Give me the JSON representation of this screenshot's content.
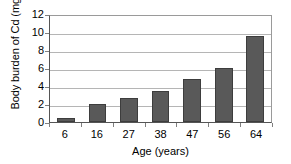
{
  "chart_data": {
    "type": "bar",
    "title": "",
    "categories": [
      "6",
      "16",
      "27",
      "38",
      "47",
      "56",
      "64"
    ],
    "values": [
      0.5,
      2.0,
      2.7,
      3.5,
      4.8,
      6.0,
      9.6
    ],
    "series": [
      {
        "name": "Body burden of Cd",
        "values": [
          0.5,
          2.0,
          2.7,
          3.5,
          4.8,
          6.0,
          9.6
        ]
      }
    ],
    "xlabel": "Age (years)",
    "ylabel": "Body burden of Cd (mg)",
    "ylim": [
      0,
      12
    ],
    "ytick_labels": [
      "0",
      "2",
      "4",
      "6",
      "8",
      "10",
      "12"
    ],
    "ytick_values": [
      0,
      2,
      4,
      6,
      8,
      10,
      12
    ],
    "grid": "horizontal",
    "legend": "none",
    "colors": {
      "bar_fill": "#595959",
      "bar_outline": "#3d3d3d",
      "gridline": "#b5b5b5",
      "axis": "#555555",
      "plot_border": "#9a9a9a",
      "text": "#000000",
      "background": "#ffffff"
    }
  }
}
